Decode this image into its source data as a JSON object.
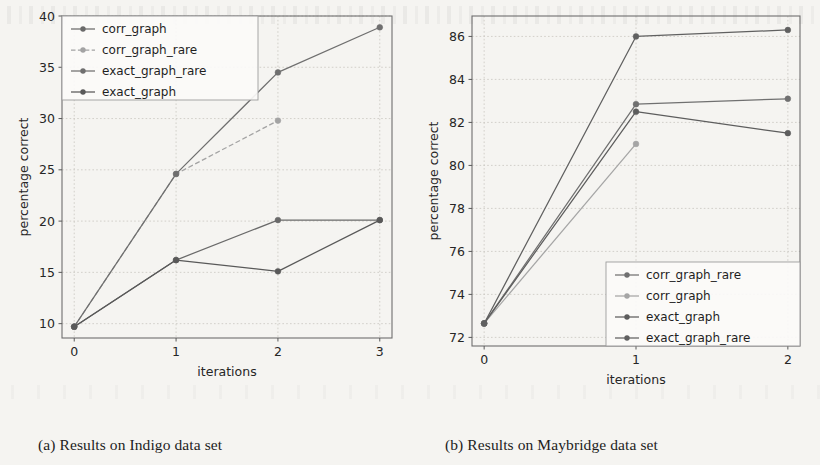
{
  "figure": {
    "caption_a": "(a) Results on Indigo data set",
    "caption_b": "(b) Results on Maybridge data set"
  },
  "chart_data": [
    {
      "type": "line",
      "panel": "a",
      "title": "(a) Results on Indigo data set",
      "xlabel": "iterations",
      "ylabel": "percentage correct",
      "x": [
        0,
        1,
        2,
        3
      ],
      "xticks": [
        "0",
        "1",
        "2",
        "3"
      ],
      "yticks": [
        "10",
        "15",
        "20",
        "25",
        "30",
        "35",
        "40"
      ],
      "xlim": [
        -0.12,
        3.12
      ],
      "ylim": [
        8.6,
        40.0
      ],
      "grid": true,
      "legend_position": "upper left",
      "series": [
        {
          "name": "corr_graph",
          "x": [
            0,
            1,
            2,
            3
          ],
          "values": [
            9.7,
            16.2,
            20.1,
            20.1
          ],
          "color": "#6a6a6a",
          "linestyle": "solid",
          "marker": "circle"
        },
        {
          "name": "corr_graph_rare",
          "x": [
            0,
            1,
            2
          ],
          "values": [
            9.7,
            24.6,
            29.8
          ],
          "color": "#a3a3a3",
          "linestyle": "dashed",
          "marker": "circle"
        },
        {
          "name": "exact_graph_rare",
          "x": [
            0,
            1,
            2,
            3
          ],
          "values": [
            9.7,
            24.6,
            34.5,
            38.9
          ],
          "color": "#6f6f6f",
          "linestyle": "solid",
          "marker": "circle"
        },
        {
          "name": "exact_graph",
          "x": [
            0,
            1,
            2,
            3
          ],
          "values": [
            9.7,
            16.2,
            15.1,
            20.1
          ],
          "color": "#595959",
          "linestyle": "solid",
          "marker": "circle"
        }
      ]
    },
    {
      "type": "line",
      "panel": "b",
      "title": "(b) Results on Maybridge data set",
      "xlabel": "iterations",
      "ylabel": "percentage correct",
      "x": [
        0,
        1,
        2
      ],
      "xticks": [
        "0",
        "1",
        "2"
      ],
      "yticks": [
        "72",
        "74",
        "76",
        "78",
        "80",
        "82",
        "84",
        "86"
      ],
      "xlim": [
        -0.08,
        2.08
      ],
      "ylim": [
        71.6,
        86.95
      ],
      "grid": true,
      "legend_position": "lower right",
      "series": [
        {
          "name": "corr_graph_rare",
          "x": [
            0,
            1,
            2
          ],
          "values": [
            72.65,
            82.85,
            83.1
          ],
          "color": "#707070",
          "linestyle": "solid",
          "marker": "circle"
        },
        {
          "name": "corr_graph",
          "x": [
            0,
            1
          ],
          "values": [
            72.65,
            81.0
          ],
          "color": "#a5a5a5",
          "linestyle": "solid",
          "marker": "circle"
        },
        {
          "name": "exact_graph",
          "x": [
            0,
            1,
            2
          ],
          "values": [
            72.65,
            82.5,
            81.5
          ],
          "color": "#5d5d5d",
          "linestyle": "solid",
          "marker": "circle"
        },
        {
          "name": "exact_graph_rare",
          "x": [
            0,
            1,
            2
          ],
          "values": [
            72.65,
            86.0,
            86.3
          ],
          "color": "#606060",
          "linestyle": "solid",
          "marker": "circle"
        }
      ]
    }
  ]
}
